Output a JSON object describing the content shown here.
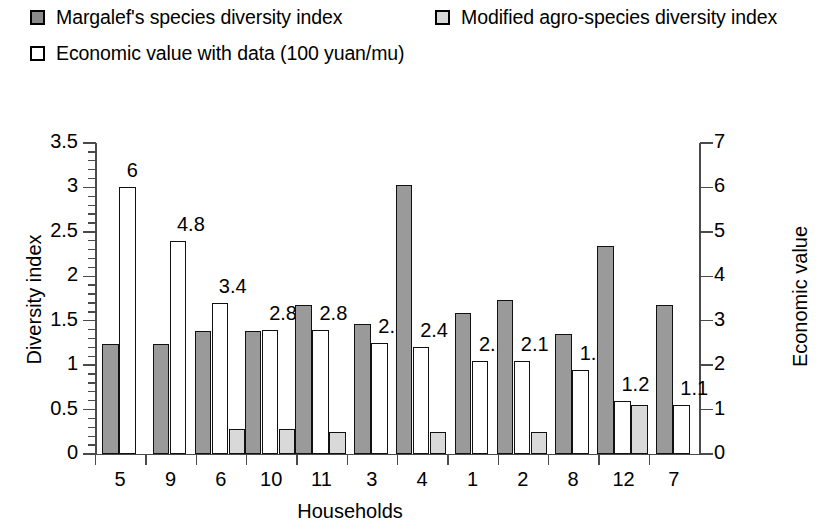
{
  "legend": {
    "items": [
      {
        "label": "Margalef's species diversity index",
        "swatch": "dark-gray-square-icon",
        "color": "#8a8a8a"
      },
      {
        "label": "Modified agro-species diversity index",
        "swatch": "light-gray-square-icon",
        "color": "#d8d8d8"
      },
      {
        "label": "Economic value with data (100 yuan/mu)",
        "swatch": "white-square-icon",
        "color": "#ffffff"
      }
    ]
  },
  "chart_data": {
    "type": "bar",
    "title": "",
    "xlabel": "Households",
    "ylabel": "Diversity index",
    "y2label": "Economic value",
    "categories": [
      "5",
      "9",
      "6",
      "10",
      "11",
      "3",
      "4",
      "1",
      "2",
      "8",
      "12",
      "7"
    ],
    "ylim": [
      0,
      3.5
    ],
    "y2lim": [
      0,
      7
    ],
    "yticks": [
      "0",
      "0.5",
      "1",
      "1.5",
      "2",
      "2.5",
      "3",
      "3.5"
    ],
    "y2ticks": [
      "0",
      "1",
      "2",
      "3",
      "4",
      "5",
      "6",
      "7"
    ],
    "grid": false,
    "legend_position": "top",
    "series": [
      {
        "name": "Margalef's species diversity index",
        "axis": "left",
        "color": "#9a9a9a",
        "values": [
          1.24,
          1.24,
          1.38,
          1.38,
          1.68,
          1.46,
          3.03,
          1.59,
          1.73,
          1.35,
          2.34,
          1.68
        ]
      },
      {
        "name": "Modified agro-species diversity index",
        "axis": "left",
        "color": "#d9d9d9",
        "values": [
          null,
          null,
          0.28,
          0.28,
          0.25,
          null,
          0.25,
          null,
          0.25,
          null,
          0.55,
          null
        ]
      },
      {
        "name": "Economic value with data (100 yuan/mu)",
        "axis": "right",
        "color": "#ffffff",
        "values": [
          6,
          4.8,
          3.4,
          2.8,
          2.8,
          2.5,
          2.4,
          2.1,
          2.1,
          1.9,
          1.2,
          1.1
        ],
        "data_labels": [
          "6",
          "4.8",
          "3.4",
          "2.8",
          "2.8",
          "2.5",
          "2.4",
          "2.1",
          "2.1",
          "1.9",
          "1.2",
          "1.1"
        ]
      }
    ]
  }
}
